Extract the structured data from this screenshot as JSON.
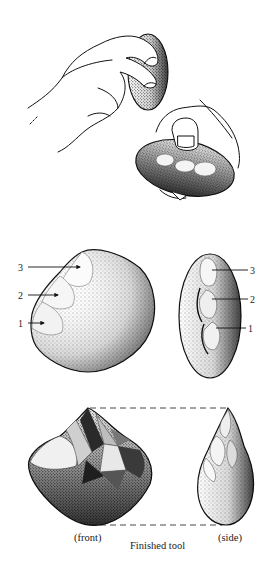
{
  "figure": {
    "panels": [
      {
        "id": "striking",
        "description": "Two hands: one holding hammerstone striking a core held in the other hand"
      },
      {
        "id": "flaked-core",
        "description": "Core after removal of three flakes, front and side views",
        "front_labels": [
          "3",
          "2",
          "1"
        ],
        "side_labels": [
          "3",
          "2",
          "1"
        ]
      },
      {
        "id": "finished-tool",
        "description": "Finished chopper tool, front and side views",
        "front_label": "(front)",
        "side_label": "(side)",
        "caption": "Finished tool"
      }
    ]
  },
  "colors": {
    "ink": "#111111",
    "paper": "#ffffff"
  }
}
